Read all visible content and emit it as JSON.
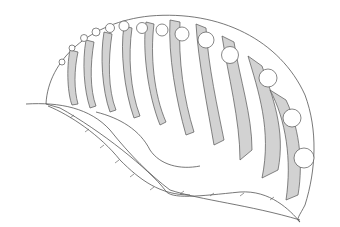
{
  "image": {
    "kind": "scientific line illustration",
    "subject": "shell-like marine organism with curved ribbed chambers",
    "colors": {
      "background": "#ffffff",
      "line": "#555555",
      "shading": "#cfcfcf"
    },
    "alt": "Pen drawing of a ribbed, shell-like organism with curved chambers and beaded edge"
  }
}
